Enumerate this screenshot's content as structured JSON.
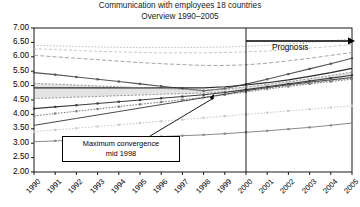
{
  "chart_data": {
    "type": "line",
    "title": "Communication with employees 18 countries",
    "subtitle": "Overview 1990–2005",
    "xlabel": "",
    "ylabel": "",
    "grid": false,
    "legend": "none",
    "ylim": [
      2.0,
      7.0
    ],
    "ytick_step": 0.5,
    "yticks": [
      "7.00",
      "6.50",
      "6.00",
      "5.50",
      "5.00",
      "4.50",
      "4.00",
      "3.50",
      "3.00",
      "2.50",
      "2.00"
    ],
    "categories": [
      "1990",
      "1991",
      "1992",
      "1993",
      "1994",
      "1995",
      "1996",
      "1997",
      "1998",
      "1999",
      "2000",
      "2001",
      "2002",
      "2003",
      "2004",
      "2005"
    ],
    "x": [
      1990,
      1991,
      1992,
      1993,
      1994,
      1995,
      1996,
      1997,
      1998,
      1999,
      2000,
      2001,
      2002,
      2003,
      2004,
      2005
    ],
    "series": [
      {
        "name": "s1",
        "style": "dotted-light",
        "color": "#b9b9b9",
        "values": [
          6.4,
          6.38,
          6.36,
          6.34,
          6.33,
          6.32,
          6.32,
          6.32,
          6.33,
          6.34,
          6.36,
          6.4,
          6.45,
          6.5,
          6.56,
          6.62
        ]
      },
      {
        "name": "s2",
        "style": "dashed-light",
        "color": "#c2c2c2",
        "values": [
          6.28,
          6.25,
          6.22,
          6.19,
          6.17,
          6.15,
          6.14,
          6.14,
          6.14,
          6.15,
          6.17,
          6.2,
          6.25,
          6.3,
          6.36,
          6.43
        ]
      },
      {
        "name": "s3",
        "style": "dashed-gray",
        "color": "#9a9a9a",
        "values": [
          6.05,
          6.0,
          5.95,
          5.9,
          5.85,
          5.8,
          5.76,
          5.73,
          5.7,
          5.7,
          5.72,
          5.78,
          5.86,
          5.95,
          6.05,
          6.15
        ]
      },
      {
        "name": "s4",
        "style": "dotted-marker",
        "color": "#555555",
        "values": [
          5.45,
          5.38,
          5.3,
          5.22,
          5.14,
          5.06,
          4.98,
          4.9,
          4.82,
          4.9,
          5.05,
          5.22,
          5.4,
          5.58,
          5.76,
          5.95
        ]
      },
      {
        "name": "s5",
        "style": "solid-dark",
        "color": "#2b2b2b",
        "values": [
          4.92,
          4.92,
          4.92,
          4.92,
          4.92,
          4.92,
          4.92,
          4.92,
          4.92,
          4.96,
          5.02,
          5.1,
          5.2,
          5.32,
          5.45,
          5.6
        ]
      },
      {
        "name": "s6",
        "style": "band-upper",
        "color": "#8c8c8c",
        "values": [
          5.08,
          5.05,
          5.02,
          4.99,
          4.96,
          4.93,
          4.9,
          4.87,
          4.84,
          4.88,
          4.95,
          5.04,
          5.14,
          5.24,
          5.35,
          5.47
        ]
      },
      {
        "name": "s7",
        "style": "band-lower",
        "color": "#8c8c8c",
        "values": [
          4.55,
          4.57,
          4.6,
          4.62,
          4.65,
          4.67,
          4.7,
          4.72,
          4.74,
          4.78,
          4.84,
          4.92,
          5.0,
          5.08,
          5.17,
          5.26
        ]
      },
      {
        "name": "s8",
        "style": "dotted-marker",
        "color": "#3d3d3d",
        "values": [
          4.2,
          4.26,
          4.32,
          4.38,
          4.44,
          4.5,
          4.56,
          4.62,
          4.68,
          4.76,
          4.86,
          4.96,
          5.06,
          5.16,
          5.26,
          5.36
        ]
      },
      {
        "name": "s9",
        "style": "dotted-mid",
        "color": "#7a7a7a",
        "values": [
          3.95,
          4.03,
          4.11,
          4.19,
          4.27,
          4.35,
          4.43,
          4.51,
          4.59,
          4.68,
          4.78,
          4.88,
          4.97,
          5.06,
          5.14,
          5.22
        ]
      },
      {
        "name": "s10",
        "style": "solid-thin",
        "color": "#4a4a4a",
        "values": [
          3.62,
          3.74,
          3.86,
          3.98,
          4.1,
          4.22,
          4.34,
          4.46,
          4.58,
          4.7,
          4.82,
          4.93,
          5.03,
          5.12,
          5.2,
          5.28
        ]
      },
      {
        "name": "s11",
        "style": "dotted-light2",
        "color": "#c9c9c9",
        "values": [
          3.4,
          3.46,
          3.52,
          3.58,
          3.64,
          3.7,
          3.76,
          3.82,
          3.88,
          3.94,
          4.0,
          4.06,
          4.12,
          4.18,
          4.24,
          4.3
        ]
      },
      {
        "name": "s12",
        "style": "dotted-marker-low",
        "color": "#8a8a8a",
        "values": [
          3.05,
          3.08,
          3.11,
          3.14,
          3.17,
          3.2,
          3.23,
          3.26,
          3.29,
          3.33,
          3.38,
          3.43,
          3.49,
          3.55,
          3.62,
          3.7
        ]
      }
    ],
    "annotations": [
      {
        "name": "prognosis",
        "text": "Prognosis",
        "x_from": 2000,
        "x_to": 2005,
        "y": 6.55,
        "kind": "arrow-label"
      },
      {
        "name": "max-convergence",
        "text_line1": "Maximum convergence",
        "text_line2": "mid 1998",
        "points_to_x": 1998.5,
        "points_to_y": 4.72,
        "kind": "boxed-callout"
      },
      {
        "name": "prognosis-divider",
        "x": 2000,
        "kind": "vertical-line"
      }
    ]
  },
  "axis": {
    "y_labels": [
      "7.00",
      "6.50",
      "6.00",
      "5.50",
      "5.00",
      "4.50",
      "4.00",
      "3.50",
      "3.00",
      "2.50",
      "2.00"
    ],
    "x_labels": [
      "1990",
      "1991",
      "1992",
      "1993",
      "1994",
      "1995",
      "1996",
      "1997",
      "1998",
      "1999",
      "2000",
      "2001",
      "2002",
      "2003",
      "2004",
      "2005"
    ]
  },
  "labels": {
    "prognosis": "Prognosis",
    "convergence_line1": "Maximum convergence",
    "convergence_line2": "mid 1998"
  }
}
